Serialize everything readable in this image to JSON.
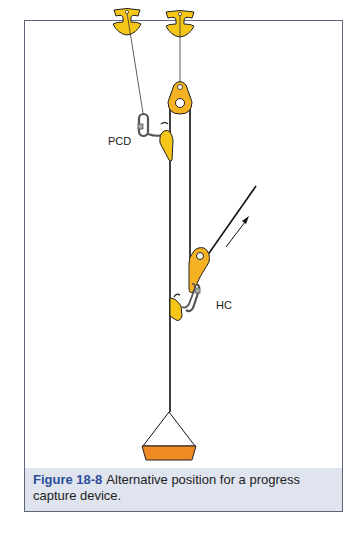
{
  "figure": {
    "number": "Figure 18-8",
    "caption": "Alternative position for a progress capture device.",
    "colors": {
      "frame_border": "#5d6678",
      "caption_background": "#dfe4ee",
      "figure_number": "#2a4f9a",
      "yellow_hardware": "#f5c518",
      "orange_load": "#f08a24",
      "rope": "#111111"
    }
  },
  "labels": {
    "pcd": "PCD",
    "hc": "HC"
  },
  "components": [
    {
      "name": "anchor-left",
      "type": "anchor"
    },
    {
      "name": "anchor-right",
      "type": "anchor"
    },
    {
      "name": "top-pulley",
      "type": "pulley"
    },
    {
      "name": "pcd-carabiner",
      "type": "carabiner"
    },
    {
      "name": "pcd-cam",
      "type": "progress-capture-device"
    },
    {
      "name": "hc-pulley",
      "type": "pulley"
    },
    {
      "name": "hc-carabiner",
      "type": "carabiner"
    },
    {
      "name": "hc-cam",
      "type": "haul-cam"
    },
    {
      "name": "pull-direction-arrow",
      "type": "arrow"
    },
    {
      "name": "load",
      "type": "load"
    }
  ]
}
